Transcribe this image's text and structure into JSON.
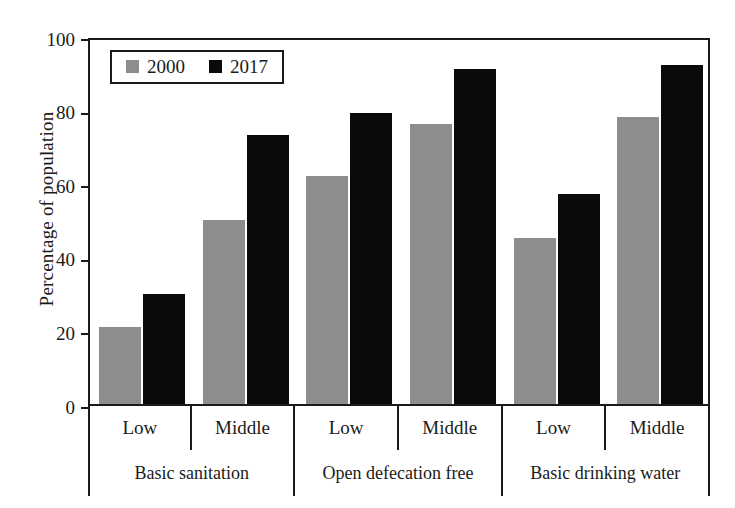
{
  "chart_data": {
    "type": "bar",
    "title": "",
    "xlabel": "",
    "ylabel": "Percentage of population",
    "ylim": [
      0,
      100
    ],
    "yticks": [
      0,
      20,
      40,
      60,
      80,
      100
    ],
    "grid": false,
    "legend_position": "top-left",
    "categories": [
      "Low",
      "Middle",
      "Low",
      "Middle",
      "Low",
      "Middle"
    ],
    "groups": [
      {
        "label": "Basic sanitation",
        "categories": [
          "Low",
          "Middle"
        ]
      },
      {
        "label": "Open defecation free",
        "categories": [
          "Low",
          "Middle"
        ]
      },
      {
        "label": "Basic drinking water",
        "categories": [
          "Low",
          "Middle"
        ]
      }
    ],
    "series": [
      {
        "name": "2000",
        "color": "#8d8d8d",
        "values": [
          21,
          50,
          62,
          76,
          45,
          78
        ]
      },
      {
        "name": "2017",
        "color": "#0a0a0a",
        "values": [
          30,
          73,
          79,
          91,
          57,
          92
        ]
      }
    ]
  },
  "axis": {
    "y_title": "Percentage of population",
    "y_ticks": [
      "100",
      "80",
      "60",
      "40",
      "20",
      "0"
    ]
  },
  "legend": {
    "items": [
      {
        "label": "2000",
        "color": "#8d8d8d"
      },
      {
        "label": "2017",
        "color": "#0a0a0a"
      }
    ]
  }
}
